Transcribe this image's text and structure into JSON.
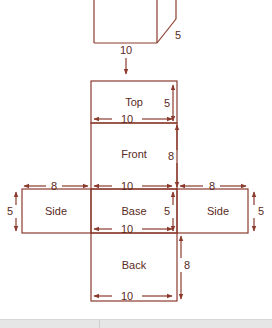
{
  "diagram": {
    "stroke_color": "#8b3a2e",
    "text_color": "#5a2a22",
    "cube": {
      "labels": {
        "width": "10",
        "depth": "5"
      }
    },
    "faces": [
      {
        "id": "top",
        "label": "Top"
      },
      {
        "id": "front",
        "label": "Front"
      },
      {
        "id": "side_left",
        "label": "Side"
      },
      {
        "id": "base",
        "label": "Base"
      },
      {
        "id": "side_right",
        "label": "Side"
      },
      {
        "id": "back",
        "label": "Back"
      }
    ],
    "dimensions": {
      "top_height": "5",
      "top_width": "10",
      "front_height": "8",
      "base_width_top": "10",
      "base_height": "5",
      "base_width_bottom": "10",
      "side_left_width": "8",
      "side_left_height": "5",
      "side_right_width": "8",
      "side_right_height": "5",
      "back_height": "8",
      "back_width": "10"
    }
  }
}
